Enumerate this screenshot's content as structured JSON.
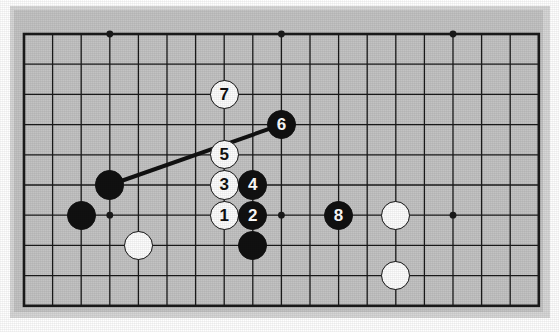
{
  "figure": {
    "kind": "go-board-diagram",
    "title": "",
    "caption": "",
    "board_color": "#c3c3c3",
    "mat_color": "#d6d6d6",
    "line_color": "#1a1a1a",
    "black_color": "#111111",
    "white_color": "#fdfdfd",
    "background_color": "#ffffff"
  },
  "board": {
    "origin_x": 24,
    "origin_y": 34,
    "col_spacing": 28.6,
    "row_spacing": 30.2,
    "cols": 18,
    "rows": 9,
    "left": 24,
    "top": 34,
    "right": 538,
    "bottom": 306,
    "border_width": 2.6,
    "line_width": 1.3
  },
  "star_points": [
    {
      "name": "star-point-1",
      "col": 3,
      "row": 0
    },
    {
      "name": "star-point-2",
      "col": 9,
      "row": 0
    },
    {
      "name": "star-point-3",
      "col": 15,
      "row": 0
    },
    {
      "name": "star-point-4",
      "col": 3,
      "row": 6
    },
    {
      "name": "star-point-5",
      "col": 9,
      "row": 6
    },
    {
      "name": "star-point-6",
      "col": 15,
      "row": 6
    }
  ],
  "stones": [
    {
      "name": "black-stone-a",
      "color": "black",
      "label": "",
      "col": 3,
      "row": 5
    },
    {
      "name": "black-stone-b",
      "color": "black",
      "label": "",
      "col": 2,
      "row": 6
    },
    {
      "name": "white-stone-a",
      "color": "white",
      "label": "",
      "col": 4,
      "row": 7
    },
    {
      "name": "black-stone-c",
      "color": "black",
      "label": "",
      "col": 8,
      "row": 7
    },
    {
      "name": "white-stone-b",
      "color": "white",
      "label": "",
      "col": 13,
      "row": 6
    },
    {
      "name": "white-stone-c",
      "color": "white",
      "label": "",
      "col": 13,
      "row": 8
    }
  ],
  "moves": [
    {
      "name": "move-stone-1",
      "label": "1",
      "color": "white",
      "col": 7,
      "row": 6
    },
    {
      "name": "move-stone-2",
      "label": "2",
      "color": "black",
      "col": 8,
      "row": 6
    },
    {
      "name": "move-stone-3",
      "label": "3",
      "color": "white",
      "col": 7,
      "row": 5
    },
    {
      "name": "move-stone-4",
      "label": "4",
      "color": "black",
      "col": 8,
      "row": 5
    },
    {
      "name": "move-stone-5",
      "label": "5",
      "color": "white",
      "col": 7,
      "row": 4
    },
    {
      "name": "move-stone-6",
      "label": "6",
      "color": "black",
      "col": 9,
      "row": 3
    },
    {
      "name": "move-stone-7",
      "label": "7",
      "color": "white",
      "col": 7,
      "row": 2
    },
    {
      "name": "move-stone-8",
      "label": "8",
      "color": "black",
      "col": 11,
      "row": 6
    }
  ],
  "connection_line": {
    "name": "connection-line",
    "from": {
      "col": 3,
      "row": 5
    },
    "to": {
      "col": 9,
      "row": 3
    },
    "width": 4,
    "color": "#111111"
  },
  "stone_radius": 14.6
}
